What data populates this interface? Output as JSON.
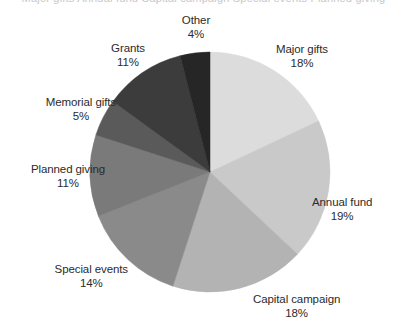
{
  "title_strip": "Major gifts  Annual fund  Capital campaign  Special events  Planned giving",
  "chart_data": {
    "type": "pie",
    "title": "",
    "xlabel": "",
    "ylabel": "",
    "legend": "none",
    "grid": false,
    "start_angle_deg": 0,
    "direction": "clockwise",
    "units": "percent",
    "categories": [
      "Major gifts",
      "Annual fund",
      "Capital campaign",
      "Special events",
      "Planned giving",
      "Memorial gifts",
      "Grants",
      "Other"
    ],
    "values": [
      18,
      19,
      18,
      14,
      11,
      5,
      11,
      4
    ],
    "total": 100,
    "colors": [
      "#dcdcdc",
      "#c9c9c9",
      "#b3b3b3",
      "#8a8a8a",
      "#7a7a7a",
      "#5a5a5a",
      "#3c3c3c",
      "#262626"
    ],
    "slices": [
      {
        "name": "Major gifts",
        "value": 18,
        "pct_label": "18%",
        "color": "#dcdcdc"
      },
      {
        "name": "Annual fund",
        "value": 19,
        "pct_label": "19%",
        "color": "#c9c9c9"
      },
      {
        "name": "Capital campaign",
        "value": 18,
        "pct_label": "18%",
        "color": "#b3b3b3"
      },
      {
        "name": "Special events",
        "value": 14,
        "pct_label": "14%",
        "color": "#8a8a8a"
      },
      {
        "name": "Planned giving",
        "value": 11,
        "pct_label": "11%",
        "color": "#7a7a7a"
      },
      {
        "name": "Memorial gifts",
        "value": 5,
        "pct_label": "5%",
        "color": "#5a5a5a"
      },
      {
        "name": "Grants",
        "value": 11,
        "pct_label": "11%",
        "color": "#3c3c3c"
      },
      {
        "name": "Other",
        "value": 4,
        "pct_label": "4%",
        "color": "#262626"
      }
    ]
  },
  "geometry": {
    "center_x": 210,
    "center_y": 172,
    "radius": 120
  },
  "labels": [
    {
      "key": "other",
      "name": "Other",
      "pct": "4%",
      "x": 196,
      "y": 14,
      "align": "anchor-c"
    },
    {
      "key": "major-gifts",
      "name": "Major gifts",
      "pct": "18%",
      "x": 276,
      "y": 43,
      "align": "anchor-l"
    },
    {
      "key": "annual-fund",
      "name": "Annual fund",
      "pct": "19%",
      "x": 312,
      "y": 196,
      "align": "anchor-l"
    },
    {
      "key": "capital-campaign",
      "name": "Capital campaign",
      "pct": "18%",
      "x": 253,
      "y": 293,
      "align": "anchor-l"
    },
    {
      "key": "special-events",
      "name": "Special events",
      "pct": "14%",
      "x": 128,
      "y": 263,
      "align": "anchor-r"
    },
    {
      "key": "planned-giving",
      "name": "Planned giving",
      "pct": "11%",
      "x": 105,
      "y": 163,
      "align": "anchor-r"
    },
    {
      "key": "memorial-gifts",
      "name": "Memorial gifts",
      "pct": "5%",
      "x": 116,
      "y": 96,
      "align": "anchor-r"
    },
    {
      "key": "grants",
      "name": "Grants",
      "pct": "11%",
      "x": 145,
      "y": 42,
      "align": "anchor-r"
    }
  ]
}
